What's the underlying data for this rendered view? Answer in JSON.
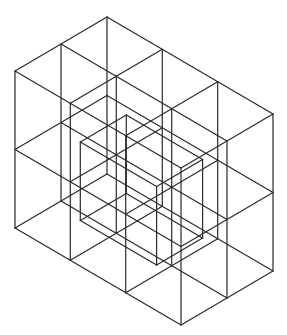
{
  "diagram": {
    "background": "#ffffff",
    "stroke_color": "#2a2a2a",
    "outer_box": {
      "front_bottom": [
        181,
        325
      ],
      "left_vec": [
        -166,
        -97
      ],
      "right_vec": [
        92,
        -54
      ],
      "height": 157,
      "divisions": {
        "left": 3,
        "right": 2,
        "vertical": 2
      }
    },
    "inner_cube": {
      "front_bottom": [
        181,
        247
      ],
      "left_vec": [
        -110.7,
        -64.7
      ],
      "right_vec": [
        92,
        -54
      ],
      "height": 157,
      "offset_note": "second slice"
    }
  }
}
